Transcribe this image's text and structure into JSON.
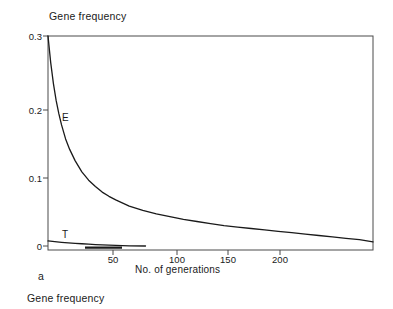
{
  "figure": {
    "panel_letter": "a",
    "caption_below": "Gene frequency",
    "y_axis_title": "Gene frequency",
    "x_axis_title": "No. of generations"
  },
  "chart_data": {
    "type": "line",
    "title": "",
    "xlabel": "No. of generations",
    "ylabel": "Gene frequency",
    "xlim": [
      0,
      240
    ],
    "ylim": [
      0,
      0.3
    ],
    "grid": false,
    "legend": "inline-curve-labels",
    "xticks": [
      50,
      100,
      150,
      200
    ],
    "xtick_labels": [
      "50",
      "100",
      "150",
      "200"
    ],
    "yticks": [
      0,
      0.1,
      0.2,
      0.3
    ],
    "ytick_labels": [
      "0",
      "0.1",
      "0.2",
      "0.3"
    ],
    "annotations": [
      {
        "text": "E",
        "x": 16,
        "y": 0.185
      },
      {
        "text": "T",
        "x": 16,
        "y": 0.022
      }
    ],
    "series": [
      {
        "name": "E",
        "label": "E",
        "color": "#1a1a1a",
        "x": [
          0,
          2,
          4,
          6,
          8,
          10,
          13,
          16,
          20,
          25,
          30,
          35,
          40,
          45,
          50,
          60,
          70,
          80,
          90,
          100,
          110,
          120,
          130,
          140,
          150,
          160,
          170,
          180,
          190,
          200,
          210,
          220,
          230,
          240
        ],
        "y": [
          0.3,
          0.262,
          0.232,
          0.208,
          0.189,
          0.173,
          0.153,
          0.138,
          0.122,
          0.106,
          0.094,
          0.085,
          0.077,
          0.071,
          0.066,
          0.057,
          0.051,
          0.046,
          0.042,
          0.038,
          0.035,
          0.032,
          0.029,
          0.027,
          0.025,
          0.023,
          0.021,
          0.019,
          0.017,
          0.015,
          0.013,
          0.011,
          0.009,
          0.006
        ]
      },
      {
        "name": "T",
        "label": "T",
        "color": "#1a1a1a",
        "x": [
          0,
          5,
          10,
          15,
          20,
          25,
          30,
          35,
          40,
          45,
          50,
          55,
          60,
          72
        ],
        "y": [
          0.0072,
          0.0062,
          0.0053,
          0.0045,
          0.0038,
          0.0032,
          0.0026,
          0.0021,
          0.0016,
          0.0012,
          0.0008,
          0.0005,
          0.0003,
          0.0
        ]
      }
    ]
  },
  "colors": {
    "axis": "#4a4a4a",
    "curve": "#1a1a1a",
    "background": "#ffffff"
  }
}
